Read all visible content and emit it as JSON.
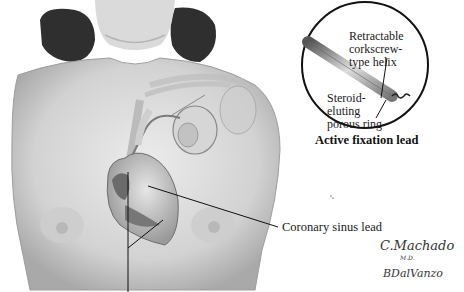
{
  "figure": {
    "labels": {
      "helix": [
        "Retractable",
        "corkscrew-",
        "type helix"
      ],
      "ring": [
        "Steroid-",
        "eluting",
        "porous ring"
      ],
      "inset_caption": "Active fixation lead",
      "coronary": "Coronary sinus lead"
    },
    "signatures": {
      "artist1": "C.Machado",
      "artist1_suffix": "M.D.",
      "artist2": "BDalVanzo"
    },
    "colors": {
      "background": "#ffffff",
      "skin": "#d9d9d9",
      "hair": "#2e2e2e",
      "line": "#111111"
    }
  }
}
